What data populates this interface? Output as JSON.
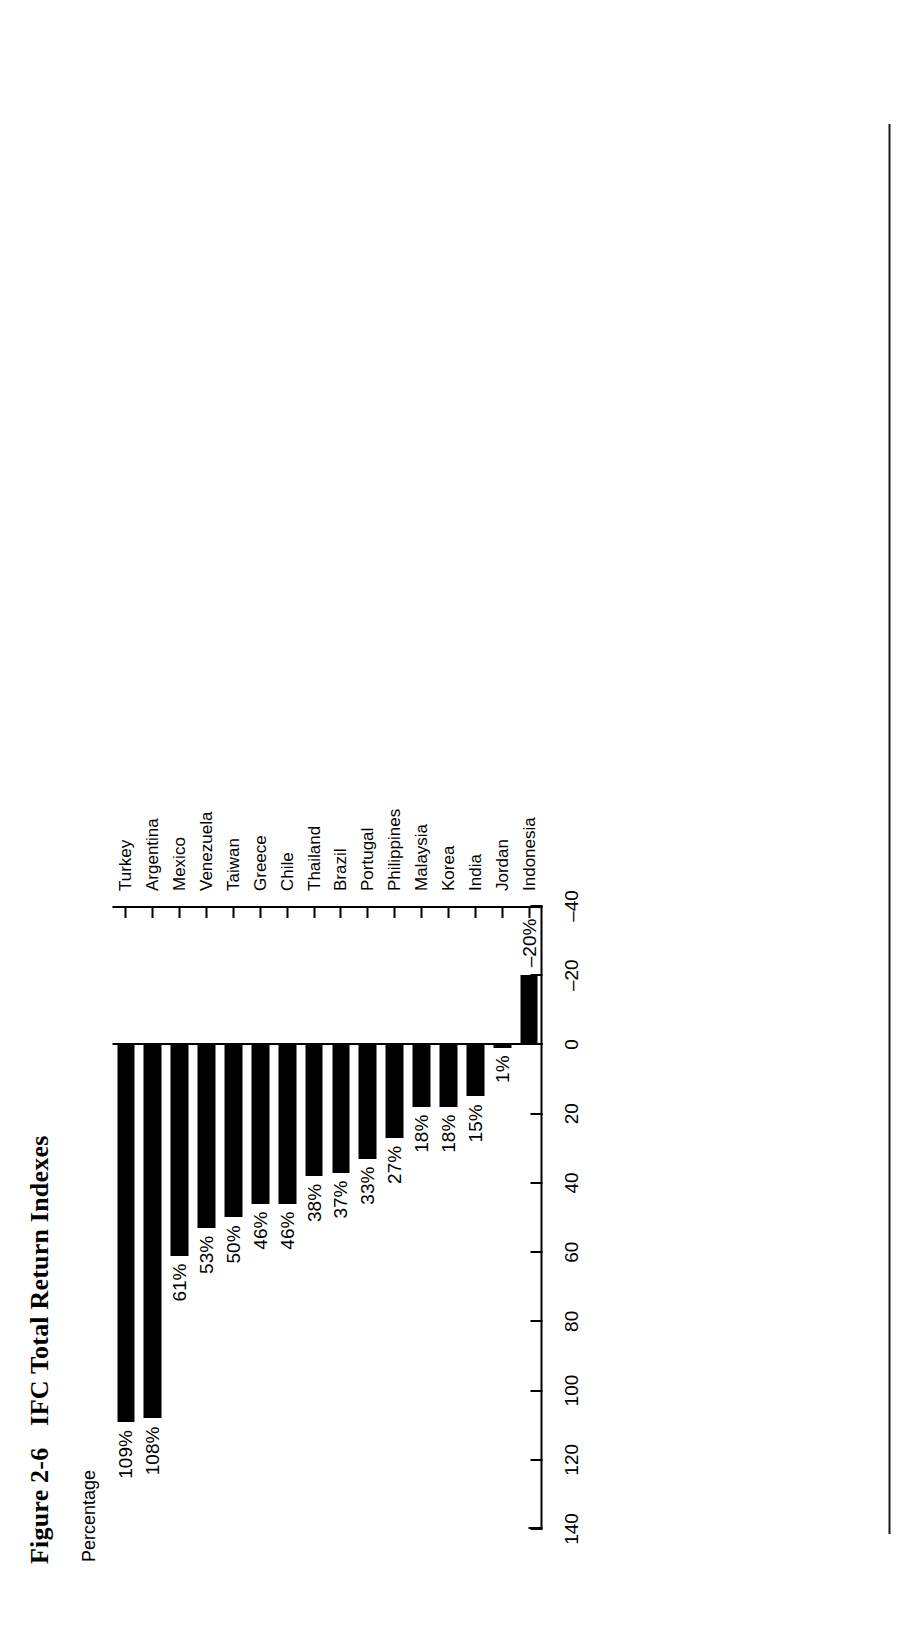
{
  "figure": {
    "number": "Figure 2-6",
    "title": "IFC Total Return Indexes",
    "axis_title": "Percentage"
  },
  "chart_data": {
    "type": "bar",
    "orientation": "vertical",
    "title": "IFC Total Return Indexes",
    "xlabel": "",
    "ylabel": "Percentage",
    "ylim": [
      -40,
      140
    ],
    "yticks": [
      140,
      120,
      100,
      80,
      60,
      40,
      20,
      0,
      -20,
      -40
    ],
    "ytick_labels": [
      "140",
      "120",
      "100",
      "80",
      "60",
      "40",
      "20",
      "0",
      "–20",
      "–40"
    ],
    "grid": false,
    "legend": null,
    "bar_color": "#000000",
    "categories": [
      "Turkey",
      "Argentina",
      "Mexico",
      "Venezuela",
      "Taiwan",
      "Greece",
      "Chile",
      "Thailand",
      "Brazil",
      "Portugal",
      "Philippines",
      "Malaysia",
      "Korea",
      "India",
      "Jordan",
      "Indonesia"
    ],
    "values": [
      109,
      108,
      61,
      53,
      50,
      46,
      46,
      38,
      37,
      33,
      27,
      18,
      18,
      15,
      1,
      -20
    ],
    "data_labels": [
      "109%",
      "108%",
      "61%",
      "53%",
      "50%",
      "46%",
      "46%",
      "38%",
      "37%",
      "33%",
      "27%",
      "18%",
      "18%",
      "15%",
      "1%",
      "–20%"
    ]
  }
}
